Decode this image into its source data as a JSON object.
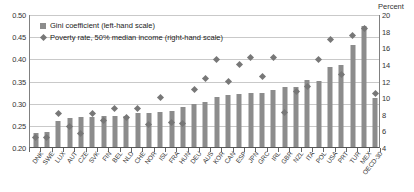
{
  "chart_data": {
    "type": "bar",
    "title": "",
    "subtitle": "",
    "xlabel": "",
    "ylabel": "",
    "y2label": "Percent",
    "grid": true,
    "legend_position": "top-left",
    "categories": [
      "DNK",
      "SWE",
      "LUX",
      "AUT",
      "CZE",
      "SVK",
      "FIN",
      "BEL",
      "NLD",
      "CHE",
      "NOR",
      "ISL",
      "FRA",
      "HUN",
      "DEU",
      "AUS",
      "KOR",
      "CAN",
      "ESP",
      "JPN",
      "GRC",
      "IRL",
      "GBR",
      "NZL",
      "ITA",
      "POL",
      "USA",
      "PRT",
      "TUR",
      "MEX",
      "OECD-30"
    ],
    "ylim": [
      0.2,
      0.5
    ],
    "yticks": [
      "0.20",
      "0.25",
      "0.30",
      "0.35",
      "0.40",
      "0.45",
      "0.50"
    ],
    "y2lim": [
      4,
      20
    ],
    "y2ticks": [
      "4",
      "6",
      "8",
      "10",
      "12",
      "14",
      "16",
      "18",
      "20"
    ],
    "series": [
      {
        "name": "Gini coefficient (left-hand scale)",
        "axis": "left",
        "kind": "bar",
        "color": "#8c8c8c",
        "values": [
          0.232,
          0.234,
          0.258,
          0.265,
          0.268,
          0.268,
          0.269,
          0.271,
          0.271,
          0.276,
          0.276,
          0.28,
          0.281,
          0.291,
          0.298,
          0.301,
          0.312,
          0.317,
          0.319,
          0.321,
          0.321,
          0.328,
          0.335,
          0.335,
          0.352,
          0.349,
          0.381,
          0.385,
          0.43,
          0.474,
          0.311
        ]
      },
      {
        "name": "Poverty rate, 50% median income (right-hand scale)",
        "axis": "right",
        "kind": "diamond",
        "color": "#777777",
        "values": [
          5.3,
          5.3,
          8.1,
          6.6,
          5.8,
          8.1,
          7.3,
          8.8,
          7.7,
          8.7,
          6.8,
          10.1,
          7.1,
          7.0,
          11.0,
          12.4,
          14.6,
          12.0,
          14.0,
          14.9,
          12.6,
          14.9,
          8.3,
          10.8,
          11.4,
          14.6,
          17.1,
          12.9,
          17.5,
          18.4,
          10.6
        ]
      }
    ]
  },
  "legend": {
    "items": [
      {
        "marker": "bar-swatch",
        "label": "Gini coefficient (left-hand scale)"
      },
      {
        "marker": "diamond-swatch",
        "label": "Poverty rate, 50% median income (right-hand scale)"
      }
    ]
  },
  "right_axis_caption": "Percent",
  "colors": {
    "bar": "#8c8c8c",
    "marker": "#777777",
    "gridline": "#c9c9c9",
    "axis": "#808080",
    "text": "#333333"
  }
}
